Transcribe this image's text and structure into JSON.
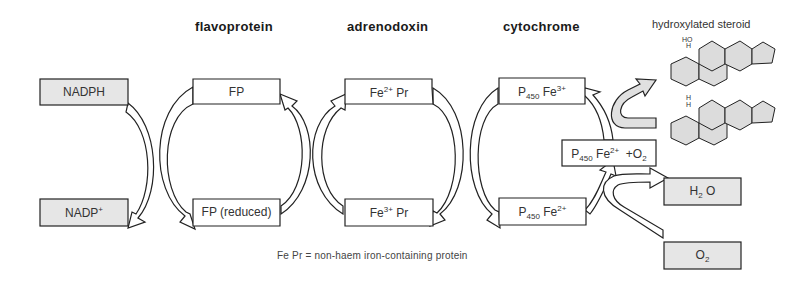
{
  "headers": {
    "flavoprotein": "flavoprotein",
    "adrenodoxin": "adrenodoxin",
    "cytochrome": "cytochrome",
    "product": "hydroxylated steroid"
  },
  "boxes": {
    "nadph": "NADPH",
    "nadp_base": "NADP",
    "nadp_sup": "+",
    "fp": "FP",
    "fp_reduced": "FP (reduced)",
    "fe2_pr_base": "Fe",
    "fe2_pr_sup": "2+",
    "fe2_pr_rest": " Pr",
    "fe3_pr_base": "Fe",
    "fe3_pr_sup": "3+",
    "fe3_pr_rest": " Pr",
    "p450_fe3_p": "P",
    "p450_fe3_sub": "450",
    "p450_fe3_fe": " Fe",
    "p450_fe3_sup": "3+",
    "p450_fe2_p": "P",
    "p450_fe2_sub": "450",
    "p450_fe2_fe": " Fe",
    "p450_fe2_sup": "2+",
    "p450_o2_p": "P",
    "p450_o2_sub": "450",
    "p450_o2_fe": " Fe",
    "p450_o2_sup": "2+",
    "p450_o2_plus": "  +O",
    "p450_o2_sub2": "2",
    "h2o_h": "H",
    "h2o_sub": "2",
    "h2o_o": " O",
    "o2_o": "O",
    "o2_sub": "2"
  },
  "steroids": {
    "top_substituent": "HO",
    "top_h": "H",
    "bottom_h1": "H",
    "bottom_h2": "H"
  },
  "footnote": "Fe Pr = non-haem iron-containing protein",
  "colors": {
    "grey_fill": "#e6e6e6",
    "white_fill": "#ffffff",
    "stroke": "#222222",
    "steroid_fill": "#dcdcdc"
  }
}
